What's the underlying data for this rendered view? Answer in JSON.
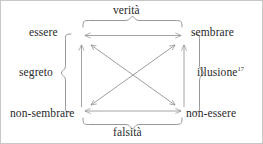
{
  "figure": {
    "type": "semiotic-square",
    "border_color": "#c8c8c8",
    "background_color": "#ffffff",
    "line_color": "#8c8c8c",
    "text_color": "#2a2a2a"
  },
  "corners": {
    "top_left": "essere",
    "top_right": "sembrare",
    "bottom_left": "non-sembrare",
    "bottom_right": "non-essere"
  },
  "relations": {
    "top": "verità",
    "bottom": "falsità",
    "left": "segreto",
    "right": "illusione",
    "right_footnote": "17"
  },
  "connectors": [
    {
      "name": "top-horizontal-arrow",
      "from": "essere",
      "to": "sembrare",
      "style": "double-headed"
    },
    {
      "name": "bottom-horizontal-arrow",
      "from": "non-sembrare",
      "to": "non-essere",
      "style": "double-headed"
    },
    {
      "name": "left-vertical-arrow",
      "from": "non-sembrare",
      "to": "essere",
      "style": "single-headed-up"
    },
    {
      "name": "right-vertical-arrow",
      "from": "non-essere",
      "to": "sembrare",
      "style": "single-headed-up"
    },
    {
      "name": "diagonal-arrow-nw-se",
      "from": "essere",
      "to": "non-essere",
      "style": "double-headed"
    },
    {
      "name": "diagonal-arrow-ne-sw",
      "from": "sembrare",
      "to": "non-sembrare",
      "style": "double-headed"
    }
  ],
  "braces": [
    {
      "name": "top-brace",
      "orientation": "horizontal-down",
      "labels": "verità"
    },
    {
      "name": "bottom-brace",
      "orientation": "horizontal-up",
      "labels": "falsità"
    },
    {
      "name": "left-brace",
      "orientation": "vertical-left",
      "labels": "segreto"
    },
    {
      "name": "right-brace",
      "orientation": "vertical-right",
      "labels": "illusione"
    }
  ]
}
